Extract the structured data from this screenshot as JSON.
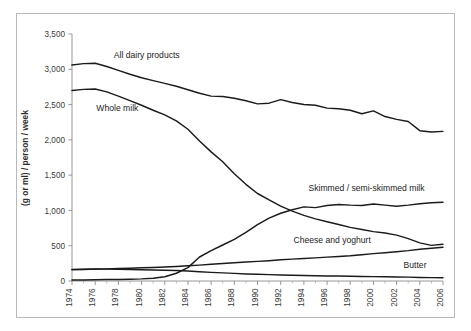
{
  "chart_data": {
    "type": "line",
    "title": "",
    "xlabel": "",
    "ylabel": "(g or ml) / person / week",
    "ylim": [
      0,
      3500
    ],
    "xlim": [
      1974,
      2006
    ],
    "grid": false,
    "legend_position": "inline-labels",
    "y_ticks": [
      "0",
      "500",
      "1,000",
      "1,500",
      "2,000",
      "2,500",
      "3,000",
      "3,500"
    ],
    "y_tick_values": [
      0,
      500,
      1000,
      1500,
      2000,
      2500,
      3000,
      3500
    ],
    "x_ticks": [
      "1974",
      "1976",
      "1978",
      "1980",
      "1982",
      "1984",
      "1986",
      "1988",
      "1990",
      "1992",
      "1994",
      "1996",
      "1998",
      "2000",
      "2002",
      "2004",
      "2006"
    ],
    "x": [
      1974,
      1975,
      1976,
      1977,
      1978,
      1979,
      1980,
      1981,
      1982,
      1983,
      1984,
      1985,
      1986,
      1987,
      1988,
      1989,
      1990,
      1991,
      1992,
      1993,
      1994,
      1995,
      1996,
      1997,
      1998,
      1999,
      2000,
      2001,
      2002,
      2003,
      2004,
      2005,
      2006
    ],
    "series": [
      {
        "name": "All dairy products",
        "label": "All dairy products",
        "color": "#1a1a1a",
        "values": [
          3060,
          3080,
          3085,
          3040,
          2985,
          2930,
          2880,
          2840,
          2800,
          2760,
          2710,
          2660,
          2620,
          2615,
          2590,
          2555,
          2510,
          2520,
          2570,
          2530,
          2500,
          2490,
          2450,
          2440,
          2420,
          2370,
          2410,
          2330,
          2290,
          2260,
          2130,
          2110,
          2120
        ]
      },
      {
        "name": "Whole milk",
        "label": "Whole milk",
        "color": "#1a1a1a",
        "values": [
          2700,
          2715,
          2720,
          2680,
          2620,
          2555,
          2490,
          2420,
          2355,
          2270,
          2150,
          1985,
          1830,
          1690,
          1520,
          1370,
          1240,
          1150,
          1060,
          990,
          930,
          880,
          840,
          800,
          760,
          730,
          700,
          680,
          650,
          600,
          540,
          505,
          520
        ]
      },
      {
        "name": "Skimmed / semi-skimmed milk",
        "label": "Skimmed / semi-skimmed milk",
        "color": "#1a1a1a",
        "values": [
          15,
          15,
          18,
          20,
          22,
          25,
          30,
          40,
          60,
          110,
          190,
          340,
          430,
          510,
          590,
          690,
          800,
          890,
          960,
          1010,
          1050,
          1040,
          1070,
          1085,
          1075,
          1070,
          1090,
          1075,
          1060,
          1075,
          1095,
          1110,
          1115
        ]
      },
      {
        "name": "Cheese and yoghurt",
        "label": "Cheese and yoghurt",
        "color": "#1a1a1a",
        "values": [
          160,
          163,
          168,
          172,
          178,
          182,
          188,
          192,
          198,
          205,
          215,
          225,
          238,
          248,
          258,
          268,
          278,
          288,
          300,
          310,
          320,
          328,
          338,
          348,
          358,
          372,
          388,
          400,
          415,
          430,
          450,
          465,
          478
        ]
      },
      {
        "name": "Butter",
        "label": "Butter",
        "color": "#1a1a1a",
        "values": [
          165,
          168,
          170,
          168,
          165,
          162,
          160,
          157,
          152,
          148,
          142,
          132,
          122,
          115,
          108,
          100,
          95,
          90,
          85,
          82,
          78,
          75,
          72,
          70,
          68,
          65,
          62,
          60,
          58,
          55,
          50,
          48,
          46
        ]
      }
    ],
    "annotations": [
      {
        "text": "All dairy products",
        "x": 1977.6,
        "y": 3155
      },
      {
        "text": "Whole milk",
        "x": 1976.1,
        "y": 2415
      },
      {
        "text": "Skimmed / semi-skimmed milk",
        "x": 1994.4,
        "y": 1280
      },
      {
        "text": "Cheese and yoghurt",
        "x": 1993.1,
        "y": 545
      },
      {
        "text": "Butter",
        "x": 2002.6,
        "y": 185
      }
    ]
  }
}
